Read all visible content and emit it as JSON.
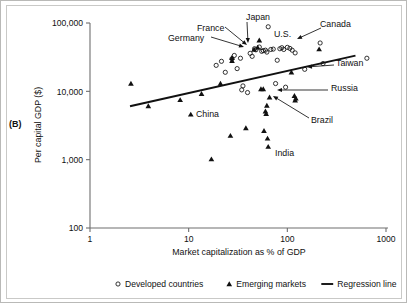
{
  "figure": {
    "panel_label": "(B)"
  },
  "chart_data": {
    "type": "scatter",
    "title": "",
    "xlabel": "Market capitalization as % of GDP",
    "ylabel": "Per capital GDP ($)",
    "xscale": "log",
    "yscale": "log",
    "xlim": [
      1,
      1000
    ],
    "ylim": [
      100,
      100000
    ],
    "xticks": [
      1,
      10,
      100,
      1000
    ],
    "xtick_labels": [
      "1",
      "10",
      "100",
      "1000"
    ],
    "yticks": [
      100,
      1000,
      10000,
      100000
    ],
    "ytick_labels": [
      "100",
      "1,000",
      "10,000",
      "100,000"
    ],
    "grid": false,
    "legend_position": "below",
    "series": [
      {
        "name": "Developed countries",
        "marker": "open-circle",
        "points": [
          {
            "x": 19.0,
            "y": 24000
          },
          {
            "x": 21.5,
            "y": 27500
          },
          {
            "x": 23.5,
            "y": 19000
          },
          {
            "x": 27.5,
            "y": 30000
          },
          {
            "x": 29.0,
            "y": 33500
          },
          {
            "x": 31.0,
            "y": 21500
          },
          {
            "x": 33.5,
            "y": 30500
          },
          {
            "x": 34.5,
            "y": 10500
          },
          {
            "x": 35.5,
            "y": 12000
          },
          {
            "x": 39.5,
            "y": 9600
          },
          {
            "x": 42.0,
            "y": 36000
          },
          {
            "x": 44.0,
            "y": 32500
          },
          {
            "x": 46.5,
            "y": 42000
          },
          {
            "x": 48.0,
            "y": 40500
          },
          {
            "x": 52.0,
            "y": 44500
          },
          {
            "x": 55.0,
            "y": 38500
          },
          {
            "x": 57.0,
            "y": 39500
          },
          {
            "x": 60.0,
            "y": 40000
          },
          {
            "x": 62.0,
            "y": 37500
          },
          {
            "x": 64.0,
            "y": 88000
          },
          {
            "x": 68.0,
            "y": 41000
          },
          {
            "x": 72.0,
            "y": 41500
          },
          {
            "x": 76.0,
            "y": 13000
          },
          {
            "x": 79.0,
            "y": 28500
          },
          {
            "x": 84.0,
            "y": 42000
          },
          {
            "x": 88.0,
            "y": 43500
          },
          {
            "x": 92.0,
            "y": 41000
          },
          {
            "x": 96.0,
            "y": 11500
          },
          {
            "x": 100.0,
            "y": 44000
          },
          {
            "x": 106.0,
            "y": 42500
          },
          {
            "x": 112.0,
            "y": 40000
          },
          {
            "x": 120.0,
            "y": 36500
          },
          {
            "x": 150.0,
            "y": 21000
          },
          {
            "x": 215.0,
            "y": 51000
          },
          {
            "x": 230.0,
            "y": 25500
          },
          {
            "x": 640.0,
            "y": 30500
          }
        ]
      },
      {
        "name": "Emerging markets",
        "marker": "filled-triangle",
        "points": [
          {
            "x": 2.6,
            "y": 13000
          },
          {
            "x": 3.9,
            "y": 6100
          },
          {
            "x": 8.2,
            "y": 7500
          },
          {
            "x": 10.5,
            "y": 4600
          },
          {
            "x": 13.5,
            "y": 9200
          },
          {
            "x": 17.0,
            "y": 1020
          },
          {
            "x": 21.0,
            "y": 13000
          },
          {
            "x": 26.5,
            "y": 2250
          },
          {
            "x": 27.5,
            "y": 28000
          },
          {
            "x": 27.5,
            "y": 31000
          },
          {
            "x": 38.0,
            "y": 2900
          },
          {
            "x": 46.0,
            "y": 41000
          },
          {
            "x": 50.0,
            "y": 44000
          },
          {
            "x": 52.0,
            "y": 56000
          },
          {
            "x": 54.0,
            "y": 10800
          },
          {
            "x": 57.0,
            "y": 10800
          },
          {
            "x": 58.0,
            "y": 2650
          },
          {
            "x": 60.0,
            "y": 5100
          },
          {
            "x": 61.0,
            "y": 4700
          },
          {
            "x": 62.0,
            "y": 6200
          },
          {
            "x": 63.0,
            "y": 2050
          },
          {
            "x": 64.0,
            "y": 1550
          },
          {
            "x": 66.0,
            "y": 8200
          },
          {
            "x": 110.0,
            "y": 19000
          },
          {
            "x": 118.0,
            "y": 8600
          },
          {
            "x": 120.0,
            "y": 7400
          },
          {
            "x": 122.0,
            "y": 7900
          },
          {
            "x": 210.0,
            "y": 41500
          }
        ]
      }
    ],
    "regression_line": {
      "name": "Regression line",
      "x_start": 2.6,
      "y_start": 6100,
      "x_end": 480.0,
      "y_end": 33000
    },
    "annotations": [
      {
        "label": "Japan",
        "text_x": 245,
        "text_y": 16,
        "lx1": 246,
        "ly1": 21,
        "lx2": 247,
        "ly2": 42
      },
      {
        "label": "France",
        "text_x": 196,
        "text_y": 27,
        "lx1": 224,
        "ly1": 26,
        "lx2": 246,
        "ly2": 44
      },
      {
        "label": "Germany",
        "text_x": 167,
        "text_y": 37,
        "lx1": 210,
        "ly1": 36,
        "lx2": 243,
        "ly2": 46
      },
      {
        "label": "U.S.",
        "text_x": 273,
        "text_y": 33,
        "lx1": 0,
        "ly1": 0,
        "lx2": 0,
        "ly2": 0
      },
      {
        "label": "Canada",
        "text_x": 319,
        "text_y": 23,
        "lx1": 320,
        "ly1": 27,
        "lx2": 296,
        "ly2": 38
      },
      {
        "label": "Taiwan",
        "text_x": 335,
        "text_y": 62,
        "lx1": 333,
        "ly1": 64,
        "lx2": 306,
        "ly2": 66
      },
      {
        "label": "Russia",
        "text_x": 330,
        "text_y": 87,
        "lx1": 327,
        "ly1": 89,
        "lx2": 276,
        "ly2": 89
      },
      {
        "label": "Brazil",
        "text_x": 310,
        "text_y": 119,
        "lx1": 308,
        "ly1": 117,
        "lx2": 272,
        "ly2": 95
      },
      {
        "label": "China",
        "text_x": 195,
        "text_y": 113,
        "lx1": 0,
        "ly1": 0,
        "lx2": 0,
        "ly2": 0
      },
      {
        "label": "India",
        "text_x": 274,
        "text_y": 152,
        "lx1": 0,
        "ly1": 0,
        "lx2": 0,
        "ly2": 0
      }
    ],
    "legend": [
      {
        "label": "Developed countries",
        "marker": "open-circle"
      },
      {
        "label": "Emerging markets",
        "marker": "filled-triangle"
      },
      {
        "label": "Regression line",
        "marker": "line"
      }
    ]
  }
}
